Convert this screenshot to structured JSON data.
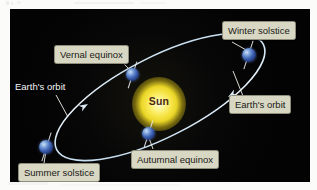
{
  "figure": {
    "background_color": "#050507",
    "page_color": "#fbfbfa",
    "orbit_color": "#cfe2f2",
    "sun_color": "#f7e447",
    "earth_color": "#3f63b4",
    "chip_color": "#d8d7c4",
    "sun_label": "Sun",
    "labels": {
      "winter_solstice": "Winter solstice",
      "vernal_equinox": "Vernal equinox",
      "earths_orbit_left": "Earth's orbit",
      "earths_orbit_right": "Earth's orbit",
      "autumnal_equinox": "Autumnal equinox",
      "summer_solstice": "Summer solstice"
    }
  }
}
